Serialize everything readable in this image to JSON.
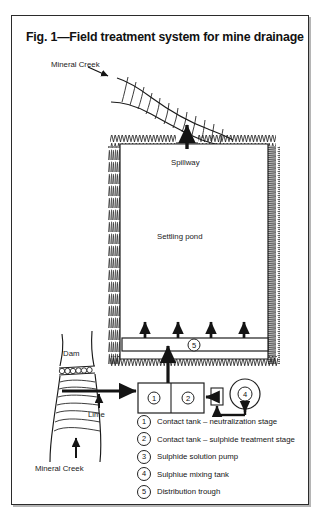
{
  "figure": {
    "title": "Fig. 1—Field treatment system for mine drainage",
    "labels": {
      "creek_top": "Mineral Creek",
      "creek_bottom": "Mineral Creek",
      "spillway": "Spillway",
      "settling_pond": "Settling pond",
      "dam": "Dam",
      "lime": "Lime"
    },
    "callouts": [
      {
        "id": "1",
        "name": "contact-tank-neutralization"
      },
      {
        "id": "2",
        "name": "contact-tank-sulphide"
      },
      {
        "id": "3",
        "name": "sulphide-solution-pump"
      },
      {
        "id": "4",
        "name": "sulphide-mixing-tank"
      },
      {
        "id": "5",
        "name": "distribution-trough"
      }
    ],
    "legend": [
      {
        "num": "1",
        "text": "Contact tank – neutralization stage"
      },
      {
        "num": "2",
        "text": "Contact tank – sulphide treatment stage"
      },
      {
        "num": "3",
        "text": "Sulphide solution pump"
      },
      {
        "num": "4",
        "text": "Sulphiue mixing tank"
      },
      {
        "num": "5",
        "text": "Distribution trough"
      }
    ],
    "colors": {
      "ink": "#1a1a1a",
      "frame": "#2b2b2b",
      "paper": "#ffffff"
    }
  }
}
